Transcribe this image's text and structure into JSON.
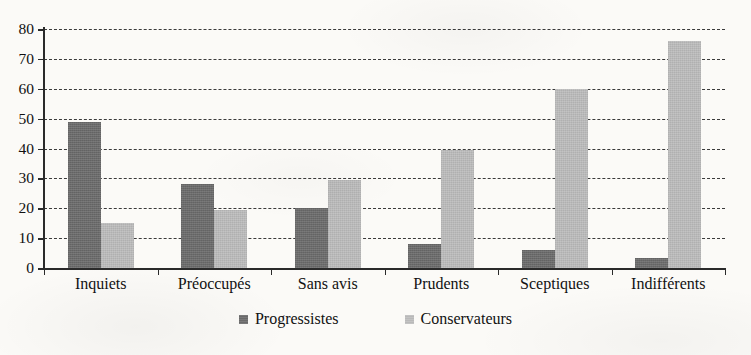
{
  "chart_data": {
    "type": "bar",
    "title": "",
    "subtitle": "",
    "xlabel": "",
    "ylabel": "",
    "ylim": [
      0,
      80
    ],
    "ytick_step": 10,
    "yticks": [
      "0",
      "10",
      "20",
      "30",
      "40",
      "50",
      "60",
      "70",
      "80"
    ],
    "grid": "horizontal-dashed",
    "legend_position": "bottom-center",
    "categories": [
      "Inquiets",
      "Préoccupés",
      "Sans avis",
      "Prudents",
      "Sceptiques",
      "Indifférents"
    ],
    "series": [
      {
        "name": "Progressistes",
        "color": "#6b6b6b",
        "values": [
          49,
          28,
          20,
          8,
          6,
          3.5
        ]
      },
      {
        "name": "Conservateurs",
        "color": "#b9b9b9",
        "values": [
          15,
          19.5,
          29.5,
          39.5,
          60,
          76
        ]
      }
    ]
  },
  "legend": {
    "items": [
      {
        "label": "Progressistes",
        "swatch": "legend-swatch-progressistes"
      },
      {
        "label": "Conservateurs",
        "swatch": "legend-swatch-conservateurs"
      }
    ]
  },
  "colors": {
    "background": "#fbfaf7",
    "axis": "#2a2a2a",
    "gridline": "#3a3a3a",
    "text": "#111111",
    "series_dark": "#6b6b6b",
    "series_light": "#b9b9b9"
  }
}
